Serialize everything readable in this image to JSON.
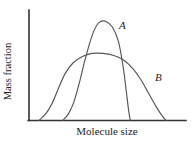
{
  "figure": {
    "background_color": "#ffffff",
    "axis_color": "#333333",
    "curve_color": "#555555",
    "text_color": "#1d1d1d"
  },
  "chart_data": {
    "type": "line",
    "title": "",
    "subtitle": "",
    "xlabel": "Molecule size",
    "ylabel": "Mass fraction",
    "xlim": [
      0,
      1
    ],
    "ylim": [
      0,
      1
    ],
    "grid": false,
    "legend": "inline-curve-labels",
    "x_ticks": [],
    "y_ticks": [],
    "x_tick_labels": [],
    "y_tick_labels": [],
    "annotations": [
      {
        "text": "A",
        "x": 0.6,
        "y": 0.9,
        "style": "italic"
      },
      {
        "text": "B",
        "x": 0.81,
        "y": 0.42,
        "style": "italic"
      }
    ],
    "series": [
      {
        "name": "A",
        "label": "A",
        "description": "Narrow, tall, sharply-peaked distribution (narrow molecular weight distribution)",
        "color": "#555555",
        "peak_y": 0.93,
        "x_start": 0.215,
        "x_end": 0.645,
        "x": [
          0.215,
          0.25,
          0.285,
          0.32,
          0.355,
          0.385,
          0.41,
          0.43,
          0.455,
          0.49,
          0.53,
          0.57,
          0.6,
          0.62,
          0.635,
          0.645
        ],
        "values": [
          0.0,
          0.06,
          0.17,
          0.35,
          0.56,
          0.72,
          0.83,
          0.89,
          0.93,
          0.93,
          0.88,
          0.74,
          0.5,
          0.27,
          0.09,
          0.0
        ]
      },
      {
        "name": "B",
        "label": "B",
        "description": "Broad, lower, plateau-shaped distribution (broad molecular weight distribution)",
        "color": "#555555",
        "peak_y": 0.63,
        "x_start": 0.064,
        "x_end": 0.873,
        "x": [
          0.064,
          0.11,
          0.15,
          0.19,
          0.23,
          0.28,
          0.34,
          0.4,
          0.47,
          0.54,
          0.6,
          0.66,
          0.71,
          0.76,
          0.81,
          0.845,
          0.873
        ],
        "values": [
          0.0,
          0.07,
          0.17,
          0.31,
          0.44,
          0.54,
          0.6,
          0.63,
          0.63,
          0.61,
          0.57,
          0.49,
          0.39,
          0.26,
          0.13,
          0.05,
          0.0
        ]
      }
    ],
    "crossings": [
      {
        "x": 0.27,
        "y": 0.56
      },
      {
        "x": 0.58,
        "y": 0.56
      }
    ]
  }
}
